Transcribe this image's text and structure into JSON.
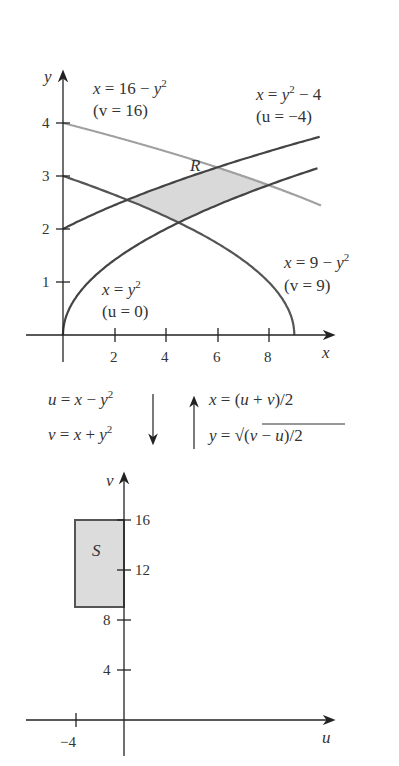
{
  "top_plot": {
    "axis_x_label": "x",
    "axis_y_label": "y",
    "x_ticks": [
      "2",
      "4",
      "6",
      "8"
    ],
    "y_ticks": [
      "1",
      "2",
      "3",
      "4"
    ],
    "region_label": "R",
    "curves": [
      {
        "eq": "x = 16 − y",
        "exp": "2",
        "param": "(v = 16)",
        "color": "#9a9a9a"
      },
      {
        "eq_pre": "x = y",
        "exp": "2",
        "eq_post": " − 4",
        "param": "(u = −4)",
        "color": "#555555"
      },
      {
        "eq_pre": "x = 9 − y",
        "exp": "2",
        "param": "(v = 9)",
        "color": "#555555"
      },
      {
        "eq_pre": "x = y",
        "exp": "2",
        "param": "(u = 0)",
        "color": "#555555"
      }
    ],
    "region_fill": "#d9d9d9"
  },
  "transform": {
    "forward": [
      "u = x − y",
      "v = x + y"
    ],
    "forward_exp": "2",
    "inverse_x": "x = (u + v)/2",
    "inverse_y_pre": "y = ",
    "inverse_y_rad": "(v − u)/2"
  },
  "bottom_plot": {
    "axis_x_label": "u",
    "axis_y_label": "v",
    "u_ticks": [
      "−4"
    ],
    "v_ticks": [
      "4",
      "8",
      "12",
      "16"
    ],
    "region_label": "S",
    "rect": {
      "u_min": -4,
      "u_max": 0,
      "v_min": 9,
      "v_max": 16
    },
    "region_fill": "#dcdcdc"
  }
}
